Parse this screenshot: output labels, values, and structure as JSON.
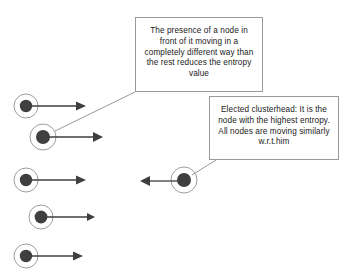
{
  "diagram": {
    "background_color": "#ffffff",
    "node_fill_color": "#3f3f3f",
    "node_ring_color": "#8c8c8c",
    "arrow_color": "#3f3f3f",
    "leader_line_color": "#8c8c8c",
    "callout_border_color": "#9a9a9a",
    "text_color": "#1a1a1a",
    "callouts": [
      {
        "id": "entropy-note",
        "name": "entropy-explanation-callout",
        "lines": [
          "The presence of a node in",
          "front of it moving in a",
          "completely different way than",
          "the rest reduces the entropy",
          "value"
        ],
        "x": 135,
        "y": 17,
        "width": 128,
        "height": 75,
        "leader_from": [
          135,
          92
        ],
        "leader_to": [
          55,
          131
        ]
      },
      {
        "id": "clusterhead-note",
        "name": "clusterhead-explanation-callout",
        "lines": [
          "Elected clusterhead: It is the",
          "node with the highest entropy.",
          "All nodes are moving similarly",
          "w.r.t.him"
        ],
        "x": 209,
        "y": 96,
        "width": 130,
        "height": 64,
        "leader_from": [
          216,
          160
        ],
        "leader_to": [
          192,
          175
        ]
      }
    ],
    "nodes": [
      {
        "id": "node-1",
        "name": "mobile-node-1",
        "cx": 26,
        "cy": 106,
        "outer_r": 12,
        "inner_r": 6,
        "arrow_direction": "right",
        "arrow_start_x": 38,
        "arrow_end_x": 85,
        "role": "member"
      },
      {
        "id": "node-2",
        "name": "mobile-node-2",
        "cx": 43,
        "cy": 137,
        "outer_r": 13,
        "inner_r": 7,
        "arrow_direction": "right",
        "arrow_start_x": 56,
        "arrow_end_x": 102,
        "role": "member"
      },
      {
        "id": "node-3",
        "name": "mobile-node-3",
        "cx": 26,
        "cy": 180,
        "outer_r": 12,
        "inner_r": 6,
        "arrow_direction": "right",
        "arrow_start_x": 38,
        "arrow_end_x": 85,
        "role": "member"
      },
      {
        "id": "node-4",
        "name": "mobile-node-4",
        "cx": 41,
        "cy": 217,
        "outer_r": 12,
        "inner_r": 6,
        "arrow_direction": "right",
        "arrow_start_x": 53,
        "arrow_end_x": 95,
        "role": "member"
      },
      {
        "id": "node-5",
        "name": "mobile-node-5",
        "cx": 26,
        "cy": 256,
        "outer_r": 12,
        "inner_r": 6,
        "arrow_direction": "right",
        "arrow_start_x": 38,
        "arrow_end_x": 82,
        "role": "member"
      },
      {
        "id": "node-clusterhead",
        "name": "elected-clusterhead-node",
        "cx": 184,
        "cy": 180,
        "outer_r": 13,
        "inner_r": 7,
        "arrow_direction": "left",
        "arrow_start_x": 171,
        "arrow_end_x": 140,
        "role": "clusterhead"
      }
    ]
  }
}
